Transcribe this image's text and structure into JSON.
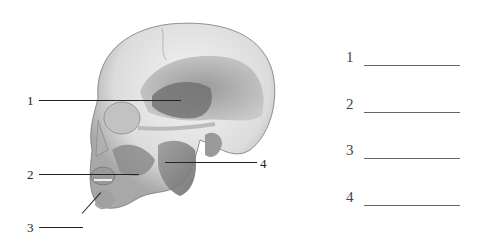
{
  "figure": {
    "callouts": [
      {
        "number": "1",
        "side": "left"
      },
      {
        "number": "2",
        "side": "left"
      },
      {
        "number": "3",
        "side": "left"
      },
      {
        "number": "4",
        "side": "right"
      }
    ]
  },
  "answers": [
    {
      "number": "1",
      "value": ""
    },
    {
      "number": "2",
      "value": ""
    },
    {
      "number": "3",
      "value": ""
    },
    {
      "number": "4",
      "value": ""
    }
  ]
}
